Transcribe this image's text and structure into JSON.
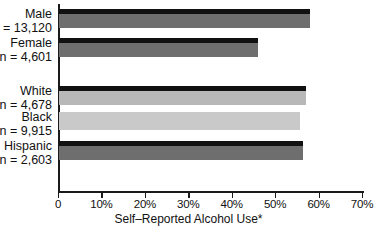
{
  "chart_data": {
    "type": "bar",
    "orientation": "horizontal",
    "title": "",
    "xlabel": "Self–Reported Alcohol Use*",
    "ylabel": "",
    "xlim": [
      0,
      70
    ],
    "xticks": [
      0,
      10,
      20,
      30,
      40,
      50,
      60,
      70
    ],
    "xtick_labels": [
      "0",
      "10%",
      "20%",
      "30%",
      "40%",
      "50%",
      "60%",
      "70%"
    ],
    "grid": false,
    "legend": "none",
    "categories": [
      "Male",
      "Female",
      "White",
      "Black",
      "Hispanic"
    ],
    "values": [
      57.8,
      45.9,
      56.9,
      55.5,
      56.2
    ],
    "bar_labels": [
      {
        "name": "Male",
        "n": "n = 13,120",
        "value": 57.8,
        "color": "#6e6e6e",
        "cap": "#111111"
      },
      {
        "name": "Female",
        "n": "n = 4,601",
        "value": 45.9,
        "color": "#6e6e6e",
        "cap": "#111111"
      },
      {
        "name": "White",
        "n": "n = 4,678",
        "value": 56.9,
        "color": "#b8b8b8",
        "cap": "#111111"
      },
      {
        "name": "Black",
        "n": "n = 9,915",
        "value": 55.5,
        "color": "#c9c9c9",
        "cap": "#c9c9c9"
      },
      {
        "name": "Hispanic",
        "n": "n = 2,603",
        "value": 56.2,
        "color": "#6e6e6e",
        "cap": "#111111"
      }
    ],
    "groups": [
      {
        "label": "sex",
        "categories": [
          "Male",
          "Female"
        ]
      },
      {
        "label": "race-ethnicity",
        "categories": [
          "White",
          "Black",
          "Hispanic"
        ]
      }
    ]
  },
  "axis": {
    "title": "Self–Reported Alcohol Use*",
    "tick_0": "0",
    "tick_10": "10%",
    "tick_20": "20%",
    "tick_30": "30%",
    "tick_40": "40%",
    "tick_50": "50%",
    "tick_60": "60%",
    "tick_70": "70%"
  },
  "rows": [
    {
      "name": "Male",
      "n": "n = 13,120"
    },
    {
      "name": "Female",
      "n": "n = 4,601"
    },
    {
      "name": "White",
      "n": "n = 4,678"
    },
    {
      "name": "Black",
      "n": "n = 9,915"
    },
    {
      "name": "Hispanic",
      "n": "n = 2,603"
    }
  ],
  "colors": {
    "bar_dark": "#6e6e6e",
    "bar_mid": "#b8b8b8",
    "bar_light": "#c9c9c9",
    "cap_black": "#111111",
    "axis": "#1a1a1a",
    "text": "#111111",
    "background": "#ffffff"
  }
}
